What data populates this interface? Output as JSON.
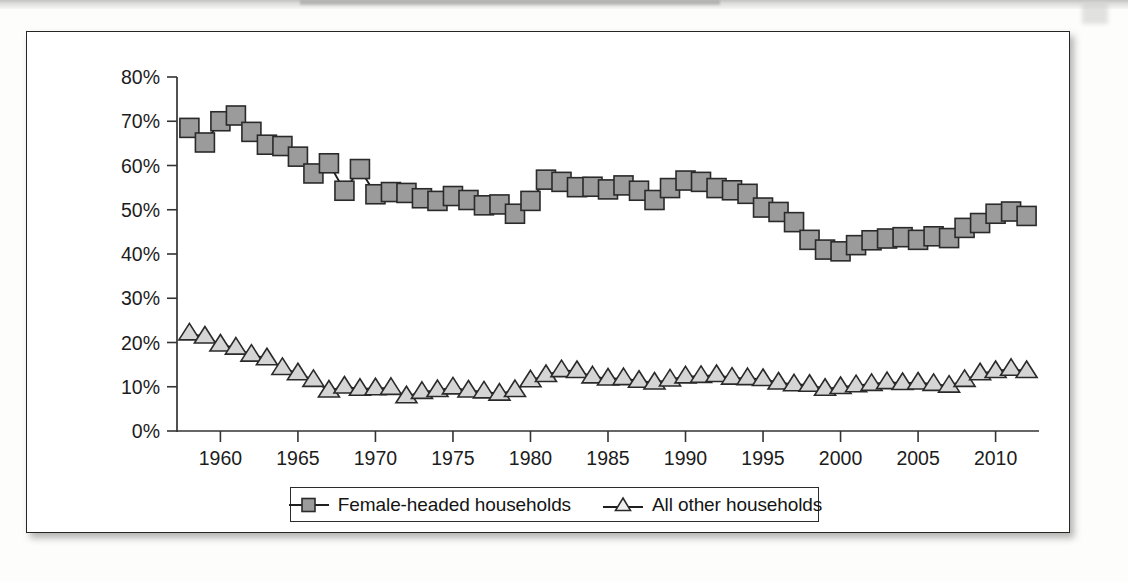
{
  "figure": {
    "background_color": "#ffffff",
    "frame_color": "#262626"
  },
  "legend": {
    "position": "bottom-center",
    "entries": [
      {
        "label": "Female-headed households",
        "marker": "filled-square-marker",
        "marker_color": "#9b9b9b"
      },
      {
        "label": "All other households",
        "marker": "open-triangle-marker",
        "marker_color": "#d5d5d5"
      }
    ]
  },
  "chart_data": {
    "type": "line",
    "title": "",
    "subtitle": "",
    "xlabel": "",
    "ylabel": "",
    "xlim": [
      1957.2,
      2012.8
    ],
    "ylim": [
      0,
      80
    ],
    "grid": false,
    "legend_position": "bottom-center",
    "y_ticks": [
      0,
      10,
      20,
      30,
      40,
      50,
      60,
      70,
      80
    ],
    "y_tick_labels": [
      "0%",
      "10%",
      "20%",
      "30%",
      "40%",
      "50%",
      "60%",
      "70%",
      "80%"
    ],
    "x_ticks": [
      1960,
      1965,
      1970,
      1975,
      1980,
      1985,
      1990,
      1995,
      2000,
      2005,
      2010
    ],
    "x_tick_labels": [
      "1960",
      "1965",
      "1970",
      "1975",
      "1980",
      "1985",
      "1990",
      "1995",
      "2000",
      "2005",
      "2010"
    ],
    "x": [
      1958,
      1959,
      1960,
      1961,
      1962,
      1963,
      1964,
      1965,
      1966,
      1967,
      1968,
      1969,
      1970,
      1971,
      1972,
      1973,
      1974,
      1975,
      1976,
      1977,
      1978,
      1979,
      1980,
      1981,
      1982,
      1983,
      1984,
      1985,
      1986,
      1987,
      1988,
      1989,
      1990,
      1991,
      1992,
      1993,
      1994,
      1995,
      1996,
      1997,
      1998,
      1999,
      2000,
      2001,
      2002,
      2003,
      2004,
      2005,
      2006,
      2007,
      2008,
      2009,
      2010,
      2011,
      2012
    ],
    "series": [
      {
        "name": "Female-headed households",
        "marker": "square",
        "values": [
          68.5,
          65.2,
          70.0,
          71.3,
          67.6,
          64.7,
          64.4,
          62.0,
          58.2,
          60.5,
          54.3,
          59.2,
          53.5,
          54.0,
          53.8,
          52.6,
          52.0,
          53.1,
          52.2,
          51.0,
          51.2,
          49.1,
          52.0,
          56.8,
          56.3,
          55.1,
          55.2,
          54.6,
          55.5,
          54.3,
          52.2,
          54.9,
          56.6,
          56.3,
          54.9,
          54.4,
          53.6,
          50.5,
          49.5,
          47.2,
          43.2,
          41.0,
          40.6,
          42.0,
          43.1,
          43.5,
          43.8,
          43.2,
          44.0,
          43.6,
          45.9,
          47.0,
          49.1,
          49.6,
          48.6
        ]
      },
      {
        "name": "All other households",
        "marker": "triangle",
        "values": [
          22.0,
          21.3,
          19.5,
          18.8,
          17.2,
          16.4,
          14.2,
          13.0,
          11.5,
          9.1,
          10.0,
          9.5,
          9.6,
          9.7,
          7.8,
          8.8,
          9.2,
          9.8,
          9.1,
          8.9,
          8.4,
          9.2,
          11.4,
          12.6,
          13.7,
          13.5,
          12.3,
          11.8,
          11.9,
          11.3,
          10.9,
          11.6,
          12.3,
          12.4,
          12.6,
          12.0,
          11.9,
          11.7,
          10.9,
          10.5,
          10.4,
          9.5,
          9.9,
          10.3,
          10.6,
          11.0,
          10.8,
          10.9,
          10.6,
          10.2,
          11.5,
          13.0,
          13.5,
          14.0,
          13.5
        ]
      }
    ]
  }
}
